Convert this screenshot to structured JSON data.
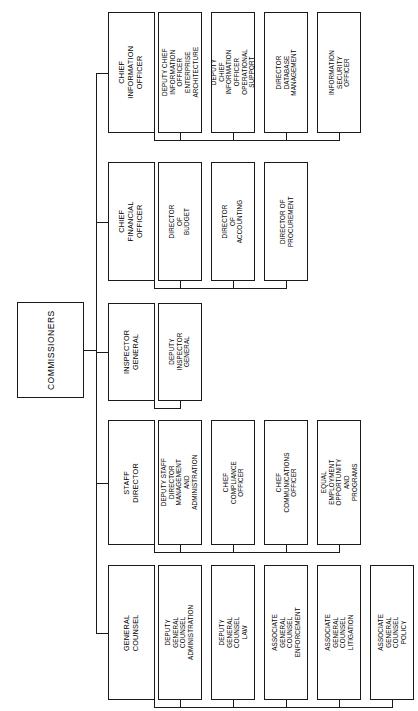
{
  "chart_data": {
    "type": "diagram",
    "diagram_type": "organization-chart",
    "orientation": "rotated-90-ccw",
    "title": "",
    "root": {
      "label": "COMMISSIONERS"
    },
    "branches": [
      {
        "label": "CHIEF INFORMATION\nOFFICER",
        "children": [
          {
            "label": "DEPUTY CHIEF\nINFORMATION OFFICER\nENTERPRISE ARCHITECTURE"
          },
          {
            "label": "DEPUTY CHIEF\nINFORMATION OFFICER\nOPERATIONAL SUPPORT"
          },
          {
            "label": "DIRECTOR\nDATABASE\nMANAGEMENT"
          },
          {
            "label": "INFORMATION\nSECURITY\nOFFICER"
          }
        ]
      },
      {
        "label": "CHIEF FINANCIAL\nOFFICER",
        "children": [
          {
            "label": "DIRECTOR OF\nBUDGET"
          },
          {
            "label": "DIRECTOR OF\nACCOUNTING"
          },
          {
            "label": "DIRECTOR OF\nPROCUREMENT"
          }
        ]
      },
      {
        "label": "INSPECTOR GENERAL",
        "children": [
          {
            "label": "DEPUTY\nINSPECTOR GENERAL"
          }
        ]
      },
      {
        "label": "STAFF DIRECTOR",
        "children": [
          {
            "label": "DEPUTY STAFF DIRECTOR\nMANAGEMENT AND\nADMINISTRATION"
          },
          {
            "label": "CHIEF\nCOMPLIANCE\nOFFICER"
          },
          {
            "label": "CHIEF\nCOMMUNICATIONS\nOFFICER"
          },
          {
            "label": "EQUAL EMPLOYMENT\nOPPORTUNITY AND\nPROGRAMS"
          }
        ]
      },
      {
        "label": "GENERAL COUNSEL",
        "children": [
          {
            "label": "DEPUTY\nGENERAL COUNSEL\nADMINISTRATION"
          },
          {
            "label": "DEPUTY\nGENERAL COUNSEL\nLAW"
          },
          {
            "label": "ASSOCIATE\nGENERAL COUNSEL\nENFORCEMENT"
          },
          {
            "label": "ASSOCIATE\nGENERAL COUNSEL\nLITIGATION"
          },
          {
            "label": "ASSOCIATE\nGENERAL COUNSEL\nPOLICY"
          }
        ]
      }
    ],
    "colors": {
      "stroke": "#1a1a1a",
      "background": "#ffffff",
      "text": "#000000"
    }
  }
}
